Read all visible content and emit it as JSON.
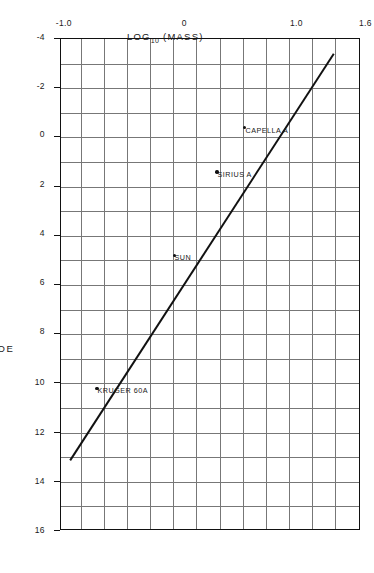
{
  "chart_data": {
    "type": "line",
    "title": "",
    "subtitle": "",
    "xlabel": "ABSOLUTE  MAGNITUDE",
    "ylabel_text": "LOG",
    "ylabel_sub": "10",
    "ylabel_tail": " (MASS)",
    "ylabel_full": "LOG10 (MASS)",
    "xlim": [
      -4,
      16
    ],
    "ylim": [
      -1.0,
      1.6
    ],
    "grid": true,
    "legend": "none",
    "orientation": "rotated-90-clockwise",
    "xticks": [
      -4,
      -2,
      0,
      2,
      4,
      6,
      8,
      10,
      12,
      14,
      16
    ],
    "xtick_labels": [
      "-4",
      "-2",
      "0",
      "2",
      "4",
      "6",
      "8",
      "10",
      "12",
      "14",
      "16"
    ],
    "yticks": [
      -1.0,
      0,
      1.0,
      1.6
    ],
    "ytick_labels": [
      "-1.0",
      "0",
      "1.0",
      "1.6"
    ],
    "x_minor_step": 1,
    "y_minor_step": 0.2,
    "series": [
      {
        "name": "mass-luminosity relation",
        "type": "line",
        "x": [
          -3.4,
          13.2
        ],
        "y": [
          1.38,
          -0.92
        ]
      }
    ],
    "points": [
      {
        "label": "CAPELLA A",
        "x": -0.4,
        "y": 0.61
      },
      {
        "label": "SIRIUS A",
        "x": 1.4,
        "y": 0.37
      },
      {
        "label": "SUN",
        "x": 4.8,
        "y": 0.0
      },
      {
        "label": "KRUGER 60A",
        "x": 10.2,
        "y": -0.67
      }
    ],
    "colors": {
      "line": "#111111",
      "grid": "#777777",
      "frame": "#111111",
      "text": "#1a1a1a",
      "background": "#ffffff"
    }
  }
}
